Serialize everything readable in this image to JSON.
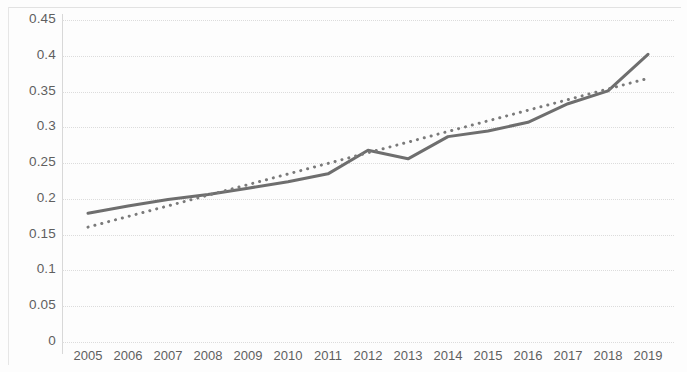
{
  "chart_data": {
    "type": "line",
    "title": "",
    "subtitle": "",
    "xlabel": "",
    "ylabel": "",
    "categories": [
      "2005",
      "2006",
      "2007",
      "2008",
      "2009",
      "2010",
      "2011",
      "2012",
      "2013",
      "2014",
      "2015",
      "2016",
      "2017",
      "2018",
      "2019"
    ],
    "x_tick_labels": [
      "2005",
      "2006",
      "2007",
      "2008",
      "2009",
      "2010",
      "2011",
      "2012",
      "2013",
      "2014",
      "2015",
      "2016",
      "2017",
      "2018",
      "2019"
    ],
    "y_tick_labels": [
      "0.45",
      "0.4",
      "0.35",
      "0.3",
      "0.25",
      "0.2",
      "0.15",
      "0.1",
      "0.05",
      "0"
    ],
    "y_tick_values": [
      0.45,
      0.4,
      0.35,
      0.3,
      0.25,
      0.2,
      0.15,
      0.1,
      0.05,
      0
    ],
    "ylim": [
      0,
      0.45
    ],
    "y_major_step": 0.05,
    "grid": "horizontal",
    "legend": "none",
    "series": [
      {
        "name": "data-series",
        "style": "solid",
        "color": "#6e6e6e",
        "line_width": 3,
        "values": [
          0.18,
          0.19,
          0.199,
          0.206,
          0.215,
          0.224,
          0.235,
          0.268,
          0.256,
          0.287,
          0.295,
          0.307,
          0.333,
          0.351,
          0.402
        ]
      },
      {
        "name": "linear-trendline",
        "style": "dotted",
        "color": "#7a7a7a",
        "line_width": 3,
        "values": [
          0.1605,
          0.1754,
          0.1902,
          0.2051,
          0.2199,
          0.2348,
          0.2496,
          0.2645,
          0.2793,
          0.2942,
          0.309,
          0.3239,
          0.3387,
          0.3536,
          0.3684
        ]
      }
    ]
  },
  "axes": {
    "y_ticks": [
      {
        "label": "0.45",
        "value": 0.45
      },
      {
        "label": "0.4",
        "value": 0.4
      },
      {
        "label": "0.35",
        "value": 0.35
      },
      {
        "label": "0.3",
        "value": 0.3
      },
      {
        "label": "0.25",
        "value": 0.25
      },
      {
        "label": "0.2",
        "value": 0.2
      },
      {
        "label": "0.15",
        "value": 0.15
      },
      {
        "label": "0.1",
        "value": 0.1
      },
      {
        "label": "0.05",
        "value": 0.05
      },
      {
        "label": "0",
        "value": 0
      }
    ],
    "x_ticks": [
      {
        "label": "2005"
      },
      {
        "label": "2006"
      },
      {
        "label": "2007"
      },
      {
        "label": "2008"
      },
      {
        "label": "2009"
      },
      {
        "label": "2010"
      },
      {
        "label": "2011"
      },
      {
        "label": "2012"
      },
      {
        "label": "2013"
      },
      {
        "label": "2014"
      },
      {
        "label": "2015"
      },
      {
        "label": "2016"
      },
      {
        "label": "2017"
      },
      {
        "label": "2018"
      },
      {
        "label": "2019"
      }
    ]
  },
  "colors": {
    "series_line": "#6e6e6e",
    "trendline": "#7a7a7a",
    "gridline": "#dcdcdc",
    "axis_line": "#d8d8d8",
    "tick_text": "#5f5f5f",
    "background": "#fdfdfd"
  }
}
